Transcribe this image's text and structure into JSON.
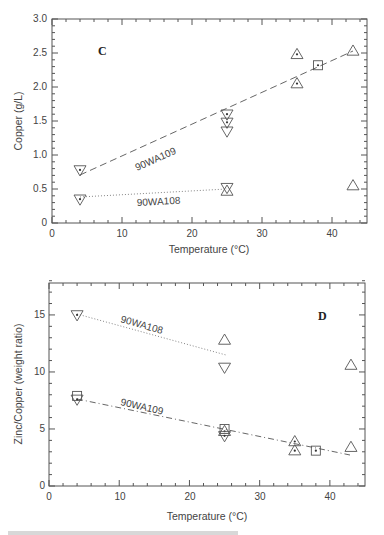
{
  "chart_data": [
    {
      "panel": "C",
      "type": "scatter",
      "title": "",
      "xlabel": "Temperature (°C)",
      "ylabel": "Copper (g/L)",
      "xlim": [
        0,
        45
      ],
      "ylim": [
        0,
        3.0
      ],
      "xticks": [
        "0",
        "10",
        "20",
        "30",
        "40"
      ],
      "yticks": [
        "0",
        "0.5",
        "1.0",
        "1.5",
        "2.0",
        "2.5",
        "3.0"
      ],
      "grid": false,
      "series": [
        {
          "name": "90WA109",
          "line_style": "dashed",
          "fit_line": [
            [
              4,
              0.7
            ],
            [
              43,
              2.5
            ]
          ],
          "points": [
            {
              "x": 4,
              "y": 0.78,
              "marker": "triangle-down-dot"
            },
            {
              "x": 25,
              "y": 1.6,
              "marker": "triangle-down-dot"
            },
            {
              "x": 25,
              "y": 1.48,
              "marker": "triangle-down-dot"
            },
            {
              "x": 25,
              "y": 1.35,
              "marker": "triangle-down"
            },
            {
              "x": 35,
              "y": 2.48,
              "marker": "triangle-up-dot"
            },
            {
              "x": 35,
              "y": 2.05,
              "marker": "triangle-up-dot"
            },
            {
              "x": 38,
              "y": 2.32,
              "marker": "square-dot"
            },
            {
              "x": 43,
              "y": 2.53,
              "marker": "triangle-up"
            }
          ]
        },
        {
          "name": "90WA108",
          "line_style": "dotted",
          "fit_line": [
            [
              4,
              0.37
            ],
            [
              25,
              0.5
            ]
          ],
          "points": [
            {
              "x": 4,
              "y": 0.35,
              "marker": "triangle-down-dot"
            },
            {
              "x": 25,
              "y": 0.52,
              "marker": "triangle-down"
            },
            {
              "x": 25,
              "y": 0.47,
              "marker": "triangle-up"
            },
            {
              "x": 43,
              "y": 0.55,
              "marker": "triangle-up"
            }
          ]
        }
      ]
    },
    {
      "panel": "D",
      "type": "scatter",
      "title": "",
      "xlabel": "Temperature (°C)",
      "ylabel": "Zinc/Copper (weight ratio)",
      "xlim": [
        0,
        45
      ],
      "ylim": [
        0,
        18
      ],
      "xticks": [
        "0",
        "10",
        "20",
        "30",
        "40"
      ],
      "yticks": [
        "0",
        "5",
        "10",
        "15"
      ],
      "grid": false,
      "series": [
        {
          "name": "90WA108",
          "line_style": "dotted",
          "fit_line": [
            [
              4,
              15.1
            ],
            [
              25,
              11.5
            ]
          ],
          "points": [
            {
              "x": 4,
              "y": 15.0,
              "marker": "triangle-down-dot"
            },
            {
              "x": 25,
              "y": 12.8,
              "marker": "triangle-up"
            },
            {
              "x": 25,
              "y": 10.4,
              "marker": "triangle-down"
            },
            {
              "x": 43,
              "y": 10.6,
              "marker": "triangle-up"
            }
          ]
        },
        {
          "name": "90WA109",
          "line_style": "dash-dot",
          "fit_line": [
            [
              4,
              7.6
            ],
            [
              43,
              2.7
            ]
          ],
          "points": [
            {
              "x": 4,
              "y": 7.9,
              "marker": "square"
            },
            {
              "x": 4,
              "y": 7.6,
              "marker": "triangle-down-dot"
            },
            {
              "x": 25,
              "y": 5.0,
              "marker": "square"
            },
            {
              "x": 25,
              "y": 4.8,
              "marker": "triangle-up-dot"
            },
            {
              "x": 25,
              "y": 4.4,
              "marker": "triangle-down-dot"
            },
            {
              "x": 35,
              "y": 3.9,
              "marker": "triangle-up-dot"
            },
            {
              "x": 35,
              "y": 3.1,
              "marker": "triangle-up-dot"
            },
            {
              "x": 38,
              "y": 3.1,
              "marker": "square-dot"
            },
            {
              "x": 43,
              "y": 3.4,
              "marker": "triangle-up"
            }
          ]
        }
      ]
    }
  ],
  "panels": {
    "c": {
      "letter": "C",
      "xlabel": "Temperature (°C)",
      "ylabel": "Copper (g/L)",
      "xticks": [
        "0",
        "10",
        "20",
        "30",
        "40"
      ],
      "yticks": [
        "0",
        "0.5",
        "1.0",
        "1.5",
        "2.0",
        "2.5",
        "3.0"
      ],
      "series_labels": [
        "90WA109",
        "90WA108"
      ]
    },
    "d": {
      "letter": "D",
      "xlabel": "Temperature (°C)",
      "ylabel": "Zinc/Copper (weight ratio)",
      "xticks": [
        "0",
        "10",
        "20",
        "30",
        "40"
      ],
      "yticks": [
        "0",
        "5",
        "10",
        "15"
      ],
      "series_labels": [
        "90WA108",
        "90WA109"
      ]
    }
  }
}
